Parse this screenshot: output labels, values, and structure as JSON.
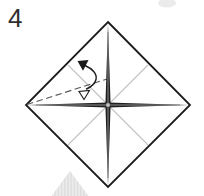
{
  "step": {
    "number": "4"
  },
  "colors": {
    "background": "#ffffff",
    "paper_fill": "#ffffff",
    "paper_outline": "#1b1b1b",
    "crease_dark": "#1f1f1f",
    "crease_core": "#8f8f8f",
    "crease_center": "#c4c4c4",
    "diagonal_crease": "#c2c2c2",
    "fold_line": "#565656",
    "arrow": "#1a1a1a",
    "watermark": "#ebebeb"
  },
  "icons": {
    "fold_arrow": "fold-unfold-arrow",
    "fold_line": "valley-fold-dashed-line"
  }
}
